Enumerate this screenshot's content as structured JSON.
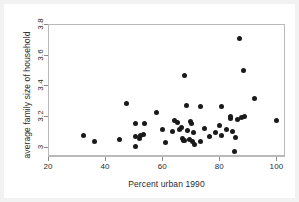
{
  "chart_data": {
    "type": "scatter",
    "title": "",
    "xlabel": "Percent urban 1990",
    "ylabel": "average family size of household",
    "xlim": [
      20,
      103
    ],
    "ylim": [
      2.94,
      3.8
    ],
    "grid": false,
    "legend": null,
    "xticks": [
      20,
      40,
      60,
      80,
      100
    ],
    "xticklabels": [
      "20",
      "40",
      "60",
      "80",
      "100"
    ],
    "yticks": [
      3,
      3.2,
      3.4,
      3.6,
      3.8
    ],
    "yticklabels": [
      "3",
      "3.2",
      "3.4",
      "3.6",
      "3.8"
    ],
    "marker": "filled-circle",
    "marker_color": "#1a1a1a",
    "marker_size_px": 5,
    "points": [
      {
        "x": 32.0,
        "y": 3.077
      },
      {
        "x": 36.0,
        "y": 3.042
      },
      {
        "x": 44.6,
        "y": 3.053
      },
      {
        "x": 47.3,
        "y": 3.286
      },
      {
        "x": 50.2,
        "y": 3.008
      },
      {
        "x": 50.3,
        "y": 3.073
      },
      {
        "x": 50.4,
        "y": 3.16
      },
      {
        "x": 51.6,
        "y": 3.062
      },
      {
        "x": 52.2,
        "y": 3.079
      },
      {
        "x": 53.0,
        "y": 3.088
      },
      {
        "x": 53.4,
        "y": 3.156
      },
      {
        "x": 57.6,
        "y": 3.232
      },
      {
        "x": 59.8,
        "y": 3.117
      },
      {
        "x": 60.8,
        "y": 3.032
      },
      {
        "x": 63.2,
        "y": 3.108
      },
      {
        "x": 63.9,
        "y": 3.18
      },
      {
        "x": 64.9,
        "y": 3.168
      },
      {
        "x": 65.6,
        "y": 3.12
      },
      {
        "x": 66.3,
        "y": 3.129
      },
      {
        "x": 66.6,
        "y": 3.06
      },
      {
        "x": 67.0,
        "y": 3.05
      },
      {
        "x": 67.4,
        "y": 3.468
      },
      {
        "x": 67.6,
        "y": 3.045
      },
      {
        "x": 68.2,
        "y": 3.275
      },
      {
        "x": 68.6,
        "y": 3.112
      },
      {
        "x": 69.1,
        "y": 3.055
      },
      {
        "x": 69.4,
        "y": 3.172
      },
      {
        "x": 69.8,
        "y": 3.16
      },
      {
        "x": 70.2,
        "y": 3.042
      },
      {
        "x": 70.6,
        "y": 3.1
      },
      {
        "x": 71.0,
        "y": 3.022
      },
      {
        "x": 73.0,
        "y": 3.272
      },
      {
        "x": 73.2,
        "y": 3.04
      },
      {
        "x": 74.4,
        "y": 3.126
      },
      {
        "x": 76.2,
        "y": 3.072
      },
      {
        "x": 78.4,
        "y": 3.098
      },
      {
        "x": 79.7,
        "y": 3.148
      },
      {
        "x": 80.3,
        "y": 3.272
      },
      {
        "x": 80.5,
        "y": 3.079
      },
      {
        "x": 82.0,
        "y": 3.118
      },
      {
        "x": 83.4,
        "y": 3.188
      },
      {
        "x": 83.7,
        "y": 3.205
      },
      {
        "x": 84.1,
        "y": 3.104
      },
      {
        "x": 84.8,
        "y": 2.974
      },
      {
        "x": 85.4,
        "y": 3.07
      },
      {
        "x": 86.0,
        "y": 3.182
      },
      {
        "x": 86.6,
        "y": 3.71
      },
      {
        "x": 87.3,
        "y": 3.196
      },
      {
        "x": 88.2,
        "y": 3.502
      },
      {
        "x": 88.4,
        "y": 3.205
      },
      {
        "x": 92.0,
        "y": 3.322
      },
      {
        "x": 99.8,
        "y": 3.176
      }
    ]
  },
  "figure": {
    "background": "#f2f2f2",
    "plot_background": "#ffffff",
    "frame_color": "#b9b9b9"
  }
}
